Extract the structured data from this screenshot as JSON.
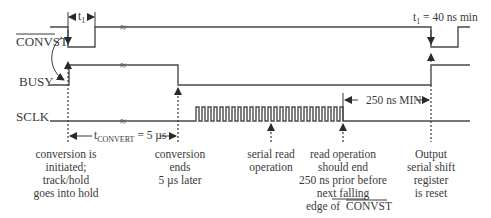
{
  "signals": {
    "convst": "CONVST",
    "busy": "BUSY",
    "sclk": "SCLK"
  },
  "timing": {
    "t1_label_main": "t",
    "t1_label_sub": "1",
    "t1_spec_prefix": "t",
    "t1_spec_sub": "1",
    "t1_spec_value": " = 40 ns min",
    "tconvert_main": "t",
    "tconvert_sub": "CONVERT",
    "tconvert_value": " = 5 µs",
    "min_250": "250 ns MIN"
  },
  "notes": {
    "conversion_initiated": [
      "conversion is",
      "initiated;",
      "track/hold",
      "goes into hold"
    ],
    "conversion_ends": [
      "conversion",
      "ends",
      "5 µs later"
    ],
    "serial_read": [
      "serial read",
      "operation"
    ],
    "read_should_end": [
      "read operation",
      "should  end",
      "250 ns prior before",
      "next falling",
      "edge of",
      "CONVST"
    ],
    "output_reset": [
      "Output",
      "serial shift",
      "register",
      "is reset"
    ]
  },
  "break_symbol": "≈",
  "colors": {
    "line": "#4a4a4a",
    "text": "#3a3a3a",
    "background": "#ffffff"
  }
}
